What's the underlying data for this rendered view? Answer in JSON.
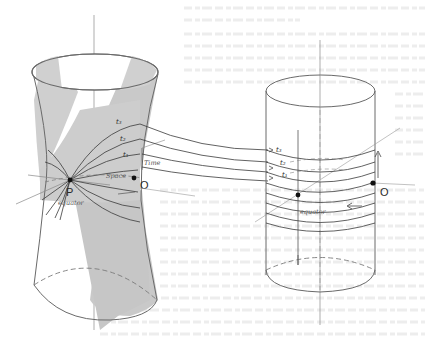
{
  "figure": {
    "colors": {
      "background": "#ffffff",
      "stroke": "#6a6a6a",
      "stroke_dark": "#3a3a3a",
      "shade": "#c8c8c8",
      "bleed_text": "#e9e9e9"
    },
    "hyperboloid": {
      "point_P_label": "P",
      "point_O_label": "O",
      "space_label": "Space",
      "time_label": "Time",
      "equator_label": "equator",
      "time_slices": [
        "t₁",
        "t₂",
        "t₃"
      ]
    },
    "cylinder": {
      "point_O_label": "O",
      "equator_label": "equator",
      "time_slices": [
        "t₁",
        "t₂",
        "t₃"
      ]
    }
  }
}
